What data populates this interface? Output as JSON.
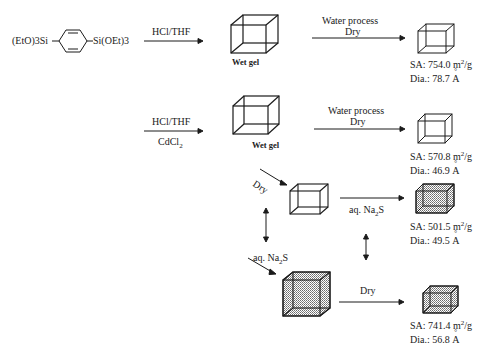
{
  "diagram": {
    "precursor": {
      "left_group": "(EtO)3Si",
      "right_group": "Si(OEt)3",
      "ring": "benzene-1,4-diyl"
    },
    "row1": {
      "reagent_label": "HCl/THF",
      "wet_gel_label": "Wet gel",
      "process_label_line1": "Water process",
      "process_label_line2": "Dry",
      "product": {
        "sa_label": "SA: 754.0 m",
        "sa_unit_sup": "2",
        "sa_unit_tail": "/g",
        "dia_label": "Dia.: 78.7 ",
        "dia_unit": "A"
      }
    },
    "row2": {
      "reagent_label_top": "HCl/THF",
      "reagent_label_bottom": "CdCl",
      "reagent_sub": "2",
      "wet_gel_label": "Wet gel",
      "process_label_line1": "Water process",
      "process_label_line2": "Dry",
      "product": {
        "sa_label": "SA: 570.8 m",
        "sa_unit_sup": "2",
        "sa_unit_tail": "/g",
        "dia_label": "Dia.: 46.9 ",
        "dia_unit": "A"
      }
    },
    "branch": {
      "dry_label": "Dry",
      "na2s_label_right": "aq. Na",
      "na2s_label_right_sub": "2",
      "na2s_label_right_tail": "S",
      "product_sulfided": {
        "sa_label": "SA: 501.5 m",
        "sa_unit_sup": "2",
        "sa_unit_tail": "/g",
        "dia_label": "Dia.: 49.5 ",
        "dia_unit": "A"
      },
      "na2s_label_left": "aq. Na",
      "na2s_label_left_sub": "2",
      "na2s_label_left_tail": "S",
      "dry_label_bottom": "Dry",
      "product_final": {
        "sa_label": "SA: 741.4 m",
        "sa_unit_sup": "2",
        "sa_unit_tail": "/g",
        "dia_label": "Dia.: 56.8 ",
        "dia_unit": "A"
      }
    },
    "colors": {
      "line": "#1a1a1a",
      "shade": "#9a9a9a",
      "background": "#ffffff"
    }
  }
}
